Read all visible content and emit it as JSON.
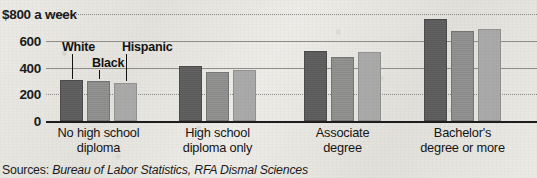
{
  "chart_data": {
    "type": "bar",
    "title": "",
    "subtitle": "",
    "xlabel": "",
    "ylabel": "$800 a week",
    "ylim": [
      0,
      800
    ],
    "grid": true,
    "legend_position": "inline-annotation",
    "axis": {
      "y_ticks": [
        0,
        200,
        400,
        600,
        800
      ],
      "y_tick_labels": [
        "0",
        "200",
        "400",
        "600",
        "$800 a week"
      ],
      "top_label": "$800 a week"
    },
    "categories": [
      "No high school diploma",
      "High school diploma only",
      "Associate degree",
      "Bachelor's degree or more"
    ],
    "category_lines": [
      [
        "No high school",
        "diploma"
      ],
      [
        "High school",
        "diploma only"
      ],
      [
        "Associate",
        "degree"
      ],
      [
        "Bachelor's",
        "degree or more"
      ]
    ],
    "series": [
      {
        "name": "White",
        "key": "white",
        "values": [
          290,
          400,
          505,
          745
        ]
      },
      {
        "name": "Black",
        "key": "black",
        "values": [
          285,
          350,
          460,
          655
        ]
      },
      {
        "name": "Hispanic",
        "key": "hispanic",
        "values": [
          268,
          365,
          500,
          672
        ]
      }
    ],
    "annotations": [
      {
        "label": "White",
        "series": "white"
      },
      {
        "label": "Black",
        "series": "black"
      },
      {
        "label": "Hispanic",
        "series": "hispanic"
      }
    ],
    "source": {
      "prefix": "Sources:",
      "text": "Bureau of Labor Statistics, RFA Dismal Sciences"
    },
    "colors": {
      "white": "#5a5a5a",
      "black": "#8a8a8a",
      "hispanic": "#a9a9a9",
      "axis": "#1c1c1c",
      "grid": "#8a8884",
      "text": "#111111",
      "background": "#e8e6e1"
    }
  }
}
